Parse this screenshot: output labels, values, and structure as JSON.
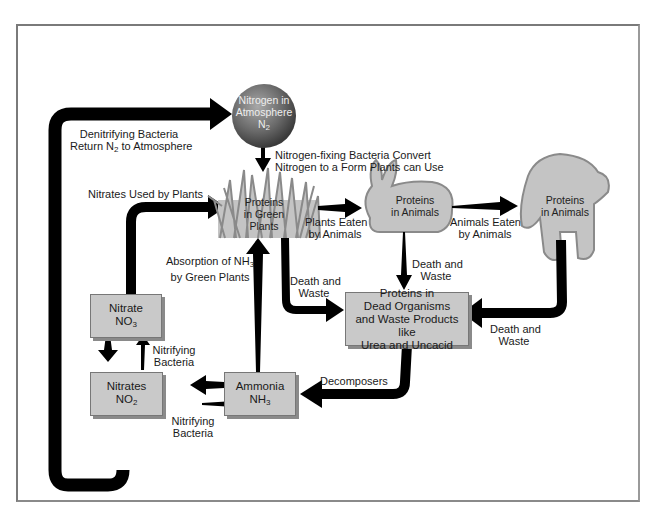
{
  "diagram": {
    "type": "nitrogen-cycle",
    "colors": {
      "arrow": "#000000",
      "box_fill": "#c9c9c9",
      "organism_fill": "#c4c4c4",
      "organism_outline": "#8a8a8a",
      "sphere_fill": "#6a6a6a",
      "frame": "#7a7a7a"
    },
    "nodes": {
      "atmosphere": {
        "line1": "Nitrogen in",
        "line2": "Atmosphere",
        "formula": "N",
        "sub": "2"
      },
      "plants": {
        "line1": "Proteins",
        "line2": "in Green",
        "line3": "Plants"
      },
      "rabbit": {
        "line1": "Proteins",
        "line2": "in Animals"
      },
      "bear": {
        "line1": "Proteins",
        "line2": "in Animals"
      },
      "dead": {
        "line1": "Proteins in",
        "line2": "Dead Organisms",
        "line3": "and Waste Products like",
        "line4": "Urea and Uncacid"
      },
      "nitrate": {
        "line1": "Nitrate",
        "formula": "NO",
        "sub": "3"
      },
      "nitrates": {
        "line1": "Nitrates",
        "formula": "NO",
        "sub": "2"
      },
      "ammonia": {
        "line1": "Ammonia",
        "formula": "NH",
        "sub": "3"
      }
    },
    "labels": {
      "denitrifying": {
        "line1": "Denitrifying Bacteria",
        "line2a": "Return N",
        "line2sub": "2",
        "line2b": " to Atmosphere"
      },
      "fixing": {
        "line1": "Nitrogen-fixing Bacteria Convert",
        "line2": "Nitrogen to a Form Plants can Use"
      },
      "nitrates_used": "Nitrates Used by Plants",
      "plants_eaten": {
        "line1": "Plants Eaten",
        "line2": "by Animals"
      },
      "animals_eaten": {
        "line1": "Animals Eaten",
        "line2": "by Animals"
      },
      "absorption": {
        "line1a": "Absorption of NH",
        "line1sub": "3",
        "line2": "by Green Plants"
      },
      "death_waste_plants": {
        "line1": "Death and",
        "line2": "Waste"
      },
      "death_waste_rabbit": {
        "line1": "Death and",
        "line2": "Waste"
      },
      "death_waste_bear": {
        "line1": "Death and",
        "line2": "Waste"
      },
      "decomposers": "Decomposers",
      "nitrifying_up": {
        "line1": "Nitrifying",
        "line2": "Bacteria"
      },
      "nitrifying_right": {
        "line1": "Nitrifying",
        "line2": "Bacteria"
      }
    }
  }
}
